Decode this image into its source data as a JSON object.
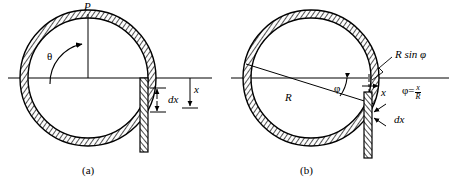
{
  "figure": {
    "background": "#ffffff",
    "ink": "#000000",
    "ring_fill": "#b9b9b9",
    "width": 449,
    "height": 187
  },
  "panels": [
    {
      "id": "a",
      "caption": "(a)",
      "center": {
        "x": 88,
        "y": 78
      },
      "radius_outer": 68,
      "radius_inner": 60,
      "labels": {
        "load": "P",
        "angle": "θ",
        "distance": "x",
        "element": "dx"
      },
      "annotations": [
        {
          "name": "load-label",
          "text": "P",
          "x": 84,
          "y": 2
        },
        {
          "name": "theta-label",
          "text": "θ",
          "x": 48,
          "y": 52
        },
        {
          "name": "x-label",
          "text": "x",
          "x": 196,
          "y": 85
        },
        {
          "name": "dx-label",
          "text": "dx",
          "x": 164,
          "y": 99
        }
      ]
    },
    {
      "id": "b",
      "caption": "(b)",
      "center": {
        "x": 311,
        "y": 78
      },
      "radius_outer": 68,
      "radius_inner": 60,
      "labels": {
        "radius": "R",
        "angle": "φ",
        "chord": "R sin φ",
        "distance": "x",
        "element": "dx",
        "relation_lhs": "φ",
        "relation_eq": "=",
        "relation_num": "x",
        "relation_den": "R"
      },
      "annotations": [
        {
          "name": "radius-label",
          "text": "R",
          "x": 287,
          "y": 93
        },
        {
          "name": "phi-label",
          "text": "φ",
          "x": 336,
          "y": 84
        },
        {
          "name": "r-sin-phi-label",
          "text": "R sin φ",
          "x": 395,
          "y": 54
        },
        {
          "name": "x-label",
          "text": "x",
          "x": 383,
          "y": 88
        },
        {
          "name": "dx-label",
          "text": "dx",
          "x": 392,
          "y": 116
        },
        {
          "name": "phi-equation",
          "text": "φ = x/R",
          "x": 404,
          "y": 85
        }
      ]
    }
  ]
}
